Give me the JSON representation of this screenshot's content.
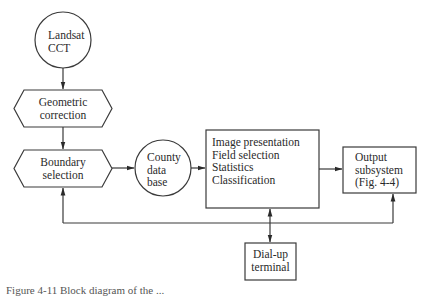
{
  "diagram": {
    "nodes": {
      "landsat": {
        "shape": "circle",
        "lines": [
          "Landsat",
          "CCT"
        ]
      },
      "geometric": {
        "shape": "hexagon",
        "lines": [
          "Geometric",
          "correction"
        ]
      },
      "boundary": {
        "shape": "hexagon",
        "lines": [
          "Boundary",
          "selection"
        ]
      },
      "county": {
        "shape": "circle",
        "lines": [
          "County",
          "data",
          "base"
        ]
      },
      "processing": {
        "shape": "rectangle",
        "lines": [
          "Image presentation",
          "Field selection",
          "Statistics",
          "Classification"
        ]
      },
      "output": {
        "shape": "rectangle",
        "lines": [
          "Output",
          "subsystem",
          "(Fig. 4-4)"
        ]
      },
      "dialup": {
        "shape": "rectangle",
        "lines": [
          "Dial-up",
          "terminal"
        ]
      }
    },
    "edges": [
      {
        "from": "landsat",
        "to": "geometric",
        "type": "arrow"
      },
      {
        "from": "geometric",
        "to": "boundary",
        "type": "arrow"
      },
      {
        "from": "boundary",
        "to": "county",
        "type": "arrow"
      },
      {
        "from": "county",
        "to": "processing",
        "type": "arrow"
      },
      {
        "from": "processing",
        "to": "output",
        "type": "arrow"
      },
      {
        "from": "processing",
        "to": "dialup",
        "type": "bidirectional"
      },
      {
        "from": "feedback-line",
        "to": "boundary",
        "type": "arrow"
      },
      {
        "from": "feedback-line",
        "to": "output",
        "type": "arrow"
      }
    ],
    "colors": {
      "line": "#3a3a3a",
      "text": "#2a2a2a",
      "background": "#ffffff"
    }
  },
  "caption": {
    "text": "Figure 4-11 Block diagram of the ..."
  }
}
